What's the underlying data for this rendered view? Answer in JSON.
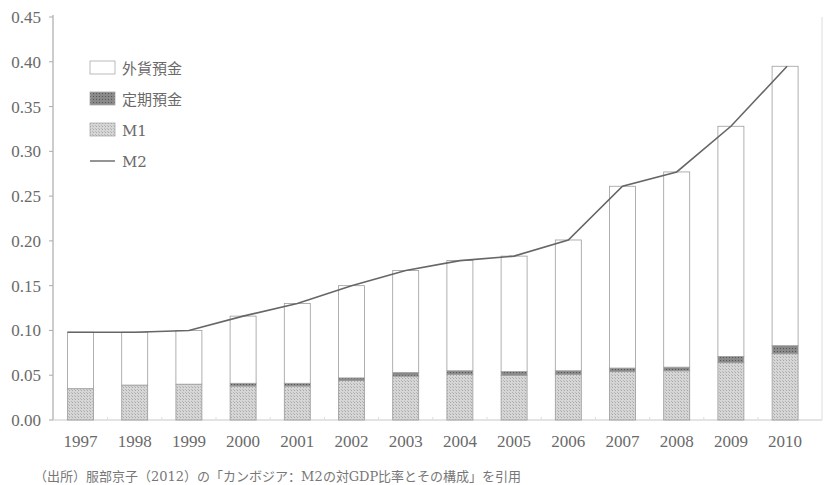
{
  "chart_data": {
    "type": "bar",
    "stacked": true,
    "title": "",
    "xlabel": "",
    "ylabel": "",
    "ylim": [
      0,
      0.45
    ],
    "ytick_step": 0.05,
    "yticks": [
      "0.00",
      "0.05",
      "0.10",
      "0.15",
      "0.20",
      "0.25",
      "0.30",
      "0.35",
      "0.40",
      "0.45"
    ],
    "grid": false,
    "legend_position": "top-left",
    "categories": [
      "1997",
      "1998",
      "1999",
      "2000",
      "2001",
      "2002",
      "2003",
      "2004",
      "2005",
      "2006",
      "2007",
      "2008",
      "2009",
      "2010"
    ],
    "series": [
      {
        "name": "M1",
        "kind": "bar",
        "color": "#d0d0d0",
        "values": [
          0.035,
          0.039,
          0.04,
          0.038,
          0.038,
          0.044,
          0.049,
          0.051,
          0.05,
          0.051,
          0.054,
          0.055,
          0.064,
          0.074
        ]
      },
      {
        "name": "定期預金",
        "kind": "bar",
        "color": "#8a8a8a",
        "values": [
          0.0,
          0.0,
          0.0,
          0.003,
          0.003,
          0.003,
          0.004,
          0.004,
          0.004,
          0.004,
          0.004,
          0.004,
          0.007,
          0.009
        ]
      },
      {
        "name": "外貨預金",
        "kind": "bar",
        "color": "#ffffff",
        "values": [
          0.063,
          0.059,
          0.06,
          0.075,
          0.089,
          0.103,
          0.114,
          0.123,
          0.129,
          0.146,
          0.203,
          0.218,
          0.257,
          0.312
        ]
      },
      {
        "name": "M2",
        "kind": "line",
        "color": "#666666",
        "values": [
          0.098,
          0.098,
          0.1,
          0.116,
          0.13,
          0.15,
          0.167,
          0.178,
          0.183,
          0.201,
          0.261,
          0.277,
          0.328,
          0.395
        ]
      }
    ],
    "legend": [
      {
        "label": "外貨預金",
        "swatch": "white-box"
      },
      {
        "label": "定期預金",
        "swatch": "dark-box"
      },
      {
        "label": "M1",
        "swatch": "light-box"
      },
      {
        "label": "M2",
        "swatch": "line"
      }
    ]
  },
  "caption": "（出所）服部京子（2012）の「カンボジア：M2の対GDP比率とその構成」を引用"
}
